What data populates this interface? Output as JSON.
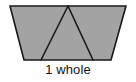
{
  "figure": {
    "name": "trapezoid-partitioned-into-three-triangles",
    "caption": "1 whole",
    "fill_color": "#a3a3a3",
    "stroke_color": "#1a1a1a",
    "background_color": "#ffffff",
    "stroke_width": 1.6,
    "part_count": 3,
    "outline": {
      "top_left": [
        10,
        6
      ],
      "top_right": [
        126,
        6
      ],
      "bottom_right": [
        111,
        60
      ],
      "bottom_left": [
        24,
        60
      ]
    },
    "divider_lines": [
      {
        "name": "left-divider",
        "from": [
          68,
          6
        ],
        "to": [
          41,
          60
        ]
      },
      {
        "name": "right-divider",
        "from": [
          68,
          6
        ],
        "to": [
          93,
          60
        ]
      }
    ],
    "triangles": [
      {
        "name": "left-triangle",
        "points": "10,6 68,6 41,60"
      },
      {
        "name": "middle-triangle",
        "points": "68,6 41,60 93,60"
      },
      {
        "name": "right-triangle",
        "points": "68,6 126,6 93,60"
      }
    ]
  }
}
